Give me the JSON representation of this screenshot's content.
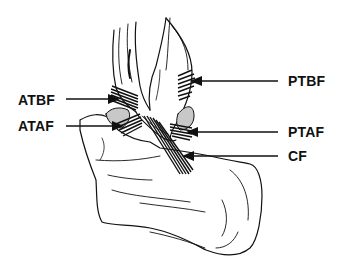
{
  "diagram": {
    "labels": {
      "atbf": "ATBF",
      "ataf": "ATAF",
      "ptbf": "PTBF",
      "ptaf": "PTAF",
      "cf": "CF"
    },
    "colors": {
      "ink": "#111111",
      "background": "#ffffff",
      "cartilage_shade": "#c8c8c8"
    }
  }
}
